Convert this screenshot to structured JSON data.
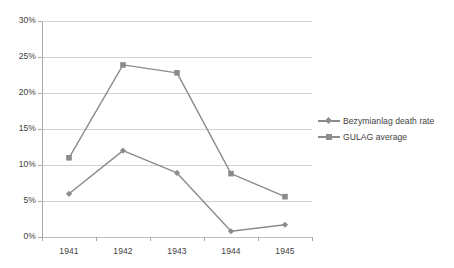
{
  "chart_data": {
    "type": "line",
    "title": "",
    "subtitle": "",
    "xlabel": "",
    "ylabel": "",
    "categories": [
      "1941",
      "1942",
      "1943",
      "1944",
      "1945"
    ],
    "series": [
      {
        "name": "Bezymianlag death rate",
        "marker": "diamond",
        "color": "#8c8c8c",
        "values": [
          6.0,
          12.0,
          8.9,
          0.8,
          1.7
        ]
      },
      {
        "name": "GULAG average",
        "marker": "square",
        "color": "#8c8c8c",
        "values": [
          11.0,
          23.9,
          22.8,
          8.8,
          5.6
        ]
      }
    ],
    "ylim": [
      0,
      30
    ],
    "ytick_values": [
      0,
      5,
      10,
      15,
      20,
      25,
      30
    ],
    "ytick_labels": [
      "0%",
      "5%",
      "10%",
      "15%",
      "20%",
      "25%",
      "30%"
    ],
    "grid": true,
    "legend_position": "right",
    "axis_color": "#a6a6a6",
    "gridline_color": "#d3d3d3",
    "background": "#ffffff"
  },
  "legend": {
    "items": [
      {
        "label": "Bezymianlag death rate",
        "marker": "diamond"
      },
      {
        "label": "GULAG average",
        "marker": "square"
      }
    ]
  }
}
